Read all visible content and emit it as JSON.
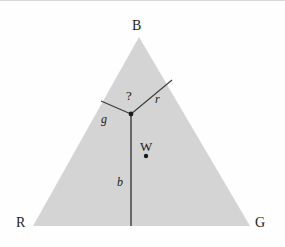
{
  "figure": {
    "background_color": "#fefefe",
    "triangle_fill_color": "#d4d4d4",
    "line_color": "#3a3a3a",
    "text_color": "#1b1b1b",
    "width": 285,
    "height": 247
  },
  "vertices": [
    {
      "id": "B",
      "label": "B",
      "name": "blue-primary",
      "x": 139,
      "y": 36
    },
    {
      "id": "R",
      "label": "R",
      "name": "red-primary",
      "x": 33,
      "y": 225
    },
    {
      "id": "G",
      "label": "G",
      "name": "green-primary",
      "x": 250,
      "y": 225
    }
  ],
  "junction": {
    "label": "",
    "name": "junction-point",
    "x": 131,
    "y": 113,
    "dot_radius": 2.4
  },
  "segments": [
    {
      "id": "r",
      "label": "r",
      "name": "segment-r",
      "from_x": 131,
      "from_y": 113,
      "to_x": 172,
      "to_y": 79
    },
    {
      "id": "g",
      "label": "g",
      "name": "segment-g",
      "from_x": 131,
      "from_y": 113,
      "to_x": 101,
      "to_y": 100
    },
    {
      "id": "b",
      "label": "b",
      "name": "segment-b",
      "from_x": 131,
      "from_y": 113,
      "to_x": 131,
      "to_y": 225
    }
  ],
  "annotations": {
    "query": "?",
    "query_name": "angle-question-mark"
  },
  "white_point": {
    "label": "W",
    "name": "white-point",
    "x": 146,
    "y": 155,
    "dot_radius": 2.2
  },
  "chart_data": {
    "type": "scatter",
    "xlabel": "",
    "ylabel": "",
    "categories": [
      "B",
      "R",
      "G",
      "W"
    ],
    "points": [
      {
        "name": "B",
        "x": 139,
        "y": 36
      },
      {
        "name": "R",
        "x": 33,
        "y": 225
      },
      {
        "name": "G",
        "x": 250,
        "y": 225
      },
      {
        "name": "junction",
        "x": 131,
        "y": 113
      },
      {
        "name": "W",
        "x": 146,
        "y": 155
      }
    ]
  }
}
